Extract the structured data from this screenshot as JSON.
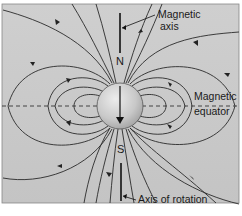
{
  "diagram": {
    "labels": {
      "magnetic_axis_line1": "Magnetic",
      "magnetic_axis_line2": "axis",
      "magnetic_equator_line1": "Magnetic",
      "magnetic_equator_line2": "equator",
      "axis_of_rotation": "Axis of rotation",
      "north": "N",
      "south": "S"
    },
    "caption": "(clipped)",
    "colors": {
      "background": "#c9c9c9",
      "sphere_light": "#e4e4e4",
      "sphere_dark": "#9a9a9a",
      "line": "#2a2a2a"
    }
  }
}
